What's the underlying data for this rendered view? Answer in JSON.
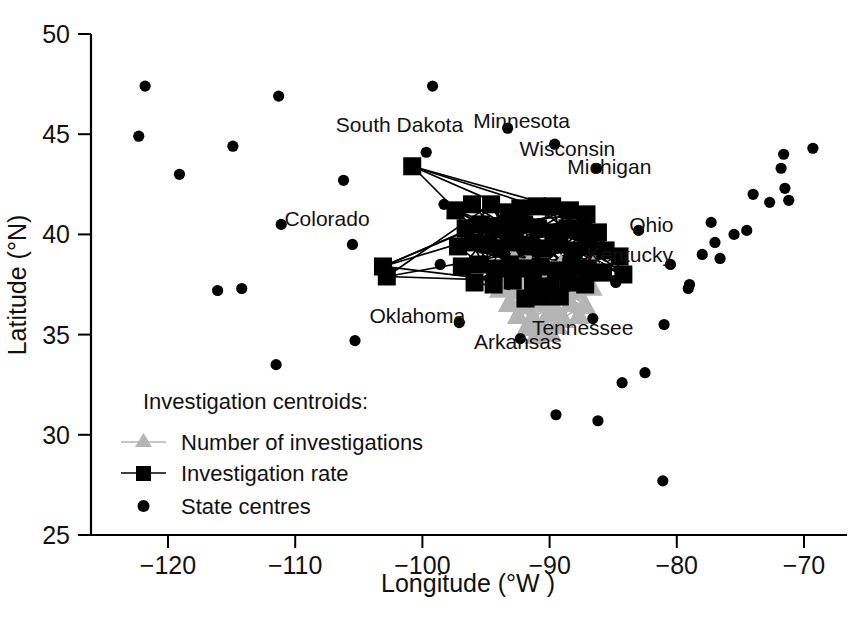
{
  "chart_data": {
    "type": "scatter",
    "title": "",
    "xlabel": "Longitude (°W )",
    "ylabel": "Latitude (°N)",
    "xlim": [
      -124,
      -68
    ],
    "ylim": [
      25,
      50
    ],
    "xticks": [
      -120,
      -110,
      -100,
      -90,
      -80,
      -70
    ],
    "xticklabels": [
      "−120",
      "−110",
      "−100",
      "−90",
      "−80",
      "−70"
    ],
    "yticks": [
      25,
      30,
      35,
      40,
      45,
      50
    ],
    "yticklabels": [
      "25",
      "30",
      "35",
      "40",
      "45",
      "50"
    ],
    "grid": false,
    "legend_position": "lower-left",
    "colors": {
      "state_centres": "#000000",
      "investigation_rate": "#000000",
      "number_of_investigations": "#b4b4b4",
      "axis": "#000000",
      "background": "#ffffff"
    },
    "series": [
      {
        "name": "State centres",
        "marker": "circle",
        "color": "#000000",
        "points": [
          [
            -121.8,
            47.4
          ],
          [
            -122.3,
            44.9
          ],
          [
            -119.1,
            43.0
          ],
          [
            -114.9,
            44.4
          ],
          [
            -116.1,
            37.2
          ],
          [
            -114.2,
            37.3
          ],
          [
            -111.3,
            46.9
          ],
          [
            -111.1,
            40.5
          ],
          [
            -111.5,
            33.5
          ],
          [
            -105.5,
            39.5
          ],
          [
            -106.2,
            42.7
          ],
          [
            -105.3,
            34.7
          ],
          [
            -99.2,
            47.4
          ],
          [
            -99.7,
            44.1
          ],
          [
            -98.3,
            41.5
          ],
          [
            -98.6,
            38.5
          ],
          [
            -97.1,
            35.6
          ],
          [
            -92.3,
            34.8
          ],
          [
            -93.3,
            45.3
          ],
          [
            -89.6,
            44.5
          ],
          [
            -86.3,
            43.3
          ],
          [
            -83.0,
            40.2
          ],
          [
            -85.0,
            39.0
          ],
          [
            -84.8,
            37.6
          ],
          [
            -86.6,
            35.8
          ],
          [
            -89.5,
            31.0
          ],
          [
            -86.2,
            30.7
          ],
          [
            -84.3,
            32.6
          ],
          [
            -82.5,
            33.1
          ],
          [
            -81.1,
            27.7
          ],
          [
            -81.0,
            35.5
          ],
          [
            -80.5,
            38.5
          ],
          [
            -79.0,
            37.5
          ],
          [
            -79.1,
            37.3
          ],
          [
            -78.0,
            39.0
          ],
          [
            -77.0,
            39.6
          ],
          [
            -76.6,
            38.8
          ],
          [
            -77.3,
            40.6
          ],
          [
            -75.5,
            40.0
          ],
          [
            -74.5,
            40.2
          ],
          [
            -74.0,
            42.0
          ],
          [
            -71.8,
            43.3
          ],
          [
            -71.5,
            42.3
          ],
          [
            -71.2,
            41.7
          ],
          [
            -72.7,
            41.6
          ],
          [
            -71.6,
            44.0
          ],
          [
            -69.3,
            44.3
          ]
        ]
      },
      {
        "name": "Investigation rate",
        "marker": "square",
        "color": "#000000",
        "connected": true,
        "points": [
          [
            -100.8,
            43.4
          ],
          [
            -103.1,
            38.4
          ],
          [
            -102.8,
            37.9
          ],
          [
            -97.4,
            41.2
          ],
          [
            -96.1,
            41.5
          ],
          [
            -94.6,
            41.5
          ],
          [
            -93.2,
            41.1
          ],
          [
            -92.3,
            41.3
          ],
          [
            -91.0,
            41.4
          ],
          [
            -89.8,
            41.4
          ],
          [
            -88.4,
            41.2
          ],
          [
            -87.1,
            41.0
          ],
          [
            -96.6,
            40.3
          ],
          [
            -95.4,
            40.5
          ],
          [
            -94.1,
            40.4
          ],
          [
            -93.0,
            40.2
          ],
          [
            -92.0,
            40.5
          ],
          [
            -90.9,
            40.3
          ],
          [
            -89.7,
            40.1
          ],
          [
            -88.6,
            40.3
          ],
          [
            -87.5,
            40.2
          ],
          [
            -86.2,
            40.1
          ],
          [
            -97.2,
            39.4
          ],
          [
            -96.0,
            39.6
          ],
          [
            -94.9,
            39.5
          ],
          [
            -93.8,
            39.3
          ],
          [
            -92.7,
            39.6
          ],
          [
            -91.6,
            39.4
          ],
          [
            -90.5,
            39.3
          ],
          [
            -89.3,
            39.5
          ],
          [
            -88.1,
            39.2
          ],
          [
            -86.9,
            39.4
          ],
          [
            -85.6,
            39.2
          ],
          [
            -84.5,
            38.9
          ],
          [
            -96.9,
            38.4
          ],
          [
            -95.6,
            38.5
          ],
          [
            -94.3,
            38.3
          ],
          [
            -93.1,
            38.5
          ],
          [
            -91.9,
            38.3
          ],
          [
            -90.7,
            38.4
          ],
          [
            -89.5,
            38.2
          ],
          [
            -88.3,
            38.4
          ],
          [
            -87.0,
            38.3
          ],
          [
            -85.8,
            38.1
          ],
          [
            -84.2,
            38.0
          ],
          [
            -95.9,
            37.6
          ],
          [
            -94.4,
            37.5
          ],
          [
            -92.9,
            37.7
          ],
          [
            -91.3,
            37.6
          ],
          [
            -89.9,
            37.4
          ],
          [
            -88.5,
            37.6
          ],
          [
            -87.2,
            37.5
          ],
          [
            -90.6,
            36.9
          ],
          [
            -89.2,
            36.9
          ],
          [
            -91.9,
            36.8
          ]
        ]
      },
      {
        "name": "Number of investigations",
        "marker": "triangle",
        "color": "#b4b4b4",
        "connected": true,
        "points": [
          [
            -92.8,
            38.8
          ],
          [
            -91.6,
            38.6
          ],
          [
            -90.4,
            38.7
          ],
          [
            -89.1,
            38.5
          ],
          [
            -87.8,
            38.6
          ],
          [
            -86.5,
            38.5
          ],
          [
            -93.4,
            38.0
          ],
          [
            -92.2,
            37.9
          ],
          [
            -91.0,
            38.1
          ],
          [
            -89.8,
            37.8
          ],
          [
            -88.6,
            38.0
          ],
          [
            -87.3,
            37.9
          ],
          [
            -86.0,
            38.1
          ],
          [
            -93.9,
            37.3
          ],
          [
            -92.7,
            37.2
          ],
          [
            -91.5,
            37.4
          ],
          [
            -90.3,
            37.1
          ],
          [
            -89.1,
            37.3
          ],
          [
            -87.9,
            37.2
          ],
          [
            -86.7,
            37.4
          ],
          [
            -93.2,
            36.6
          ],
          [
            -92.0,
            36.5
          ],
          [
            -90.8,
            36.7
          ],
          [
            -89.6,
            36.4
          ],
          [
            -88.4,
            36.6
          ],
          [
            -87.2,
            36.5
          ],
          [
            -92.5,
            36.0
          ],
          [
            -91.3,
            35.9
          ],
          [
            -90.1,
            36.1
          ],
          [
            -88.9,
            35.8
          ],
          [
            -87.7,
            36.0
          ],
          [
            -91.8,
            35.4
          ],
          [
            -90.6,
            35.3
          ],
          [
            -89.4,
            35.5
          ],
          [
            -91.1,
            35.0
          ],
          [
            -89.9,
            35.1
          ]
        ]
      }
    ],
    "annotations": [
      {
        "text": "South Dakota",
        "x": -101.8,
        "y": 45.1
      },
      {
        "text": "Minnesota",
        "x": -92.2,
        "y": 45.3
      },
      {
        "text": "Wisconsin",
        "x": -88.6,
        "y": 43.9
      },
      {
        "text": "Michigan",
        "x": -85.3,
        "y": 43.0
      },
      {
        "text": "Colorado",
        "x": -107.5,
        "y": 40.4
      },
      {
        "text": "Ohio",
        "x": -82.0,
        "y": 40.1
      },
      {
        "text": "Kentucky",
        "x": -83.7,
        "y": 38.6
      },
      {
        "text": "Oklahoma",
        "x": -100.4,
        "y": 35.6
      },
      {
        "text": "Tennessee",
        "x": -87.4,
        "y": 35.0
      },
      {
        "text": "Arkansas",
        "x": -92.5,
        "y": 34.3
      }
    ]
  },
  "legend": {
    "title": "Investigation centroids:",
    "entries": [
      {
        "label": "Number of investigations",
        "marker": "triangle-line",
        "color": "#b4b4b4"
      },
      {
        "label": "Investigation rate",
        "marker": "square-line",
        "color": "#000000"
      },
      {
        "label": "State centres",
        "marker": "circle",
        "color": "#000000"
      }
    ]
  }
}
